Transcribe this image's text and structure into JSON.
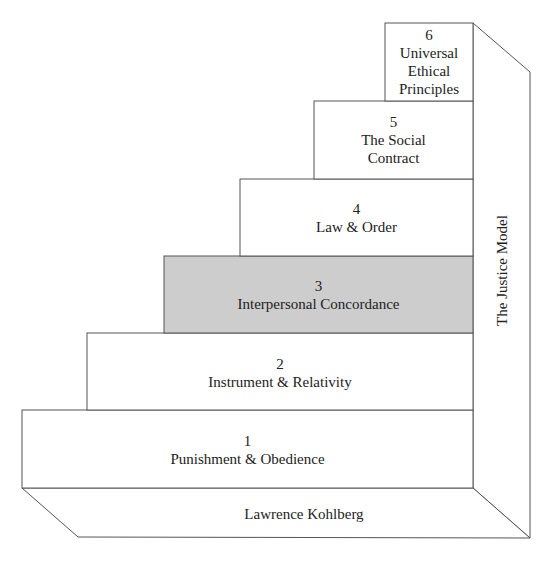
{
  "diagram": {
    "steps": [
      {
        "number": "1",
        "label": "Punishment & Obedience",
        "highlighted": false
      },
      {
        "number": "2",
        "label": "Instrument & Relativity",
        "highlighted": false
      },
      {
        "number": "3",
        "label": "Interpersonal Concordance",
        "highlighted": true
      },
      {
        "number": "4",
        "label": "Law & Order",
        "highlighted": false
      },
      {
        "number": "5",
        "label": "The Social Contract",
        "highlighted": false
      },
      {
        "number": "6",
        "label": "Universal Ethical Principles",
        "highlighted": false
      }
    ],
    "side_label": "The Justice Model",
    "base_label": "Lawrence Kohlberg",
    "colors": {
      "highlight": "#cdcdcd",
      "line": "#555555",
      "fill": "#ffffff"
    }
  }
}
